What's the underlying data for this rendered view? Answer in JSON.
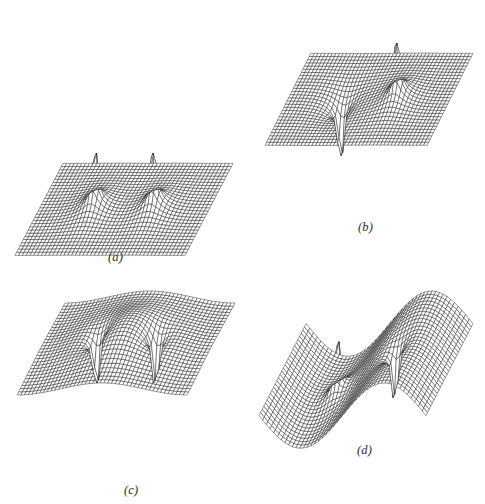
{
  "figure": {
    "background_color": "#ffffff",
    "ink_color": "#111111",
    "label_color": "#2b2b2b",
    "width": 485,
    "height": 504
  },
  "panels": [
    {
      "id": "a",
      "label": "(a)",
      "label_x": 108,
      "label_y": 250,
      "origin_x": 12,
      "origin_y": 150,
      "plot_width": 218,
      "plot_height": 100,
      "description": "two positive singular peaks on a flat plane"
    },
    {
      "id": "b",
      "label": "(b)",
      "label_x": 358,
      "label_y": 220,
      "origin_x": 262,
      "origin_y": 40,
      "plot_width": 208,
      "plot_height": 100,
      "description": "one positive peak and one negative spike on a flat plane"
    },
    {
      "id": "c",
      "label": "(c)",
      "label_x": 124,
      "label_y": 483,
      "origin_x": 14,
      "origin_y": 288,
      "plot_width": 218,
      "plot_height": 100,
      "description": "two negative spikes beneath an undulating raised surface"
    },
    {
      "id": "d",
      "label": "(d)",
      "label_x": 357,
      "label_y": 443,
      "origin_x": 256,
      "origin_y": 288,
      "plot_width": 214,
      "plot_height": 100,
      "description": "one positive peak and one negative spike on a twisted saddle surface"
    }
  ],
  "chart_data": [
    {
      "type": "surface",
      "panel": "a",
      "title": "(a)",
      "xlabel": "",
      "ylabel": "",
      "zlabel": "",
      "grid": true,
      "legend": "none",
      "nu": 46,
      "nv": 30,
      "xlim": [
        -3,
        3
      ],
      "ylim": [
        -1.6,
        1.6
      ],
      "zlim": [
        0,
        9.5
      ],
      "projection": {
        "az_x": 0.88,
        "az_y": 0.3,
        "z_scale": 20.5
      },
      "sources": [
        {
          "x": -1.05,
          "y": 0.0,
          "amplitude": 1.0,
          "sigma": 0.2
        },
        {
          "x": 1.05,
          "y": 0.0,
          "amplitude": 1.0,
          "sigma": 0.2
        }
      ],
      "baseline": 0.0,
      "peak_screen_points": [
        {
          "x": 71,
          "y": 12
        },
        {
          "x": 158,
          "y": 8
        }
      ]
    },
    {
      "type": "surface",
      "panel": "b",
      "title": "(b)",
      "xlabel": "",
      "ylabel": "",
      "zlabel": "",
      "grid": true,
      "legend": "none",
      "nu": 46,
      "nv": 30,
      "xlim": [
        -3,
        3
      ],
      "ylim": [
        -1.6,
        1.6
      ],
      "zlim": [
        -9.5,
        9.5
      ],
      "projection": {
        "az_x": 0.88,
        "az_y": 0.3,
        "z_scale": 20.5
      },
      "sources": [
        {
          "x": -1.05,
          "y": 0.0,
          "amplitude": -1.0,
          "sigma": 0.2
        },
        {
          "x": 1.05,
          "y": 0.0,
          "amplitude": 1.0,
          "sigma": 0.2
        }
      ],
      "baseline": 0.0,
      "peak_screen_points": [
        {
          "x": 404,
          "y": 42
        },
        {
          "x": 330,
          "y": 220
        }
      ]
    },
    {
      "type": "surface",
      "panel": "c",
      "title": "(c)",
      "xlabel": "",
      "ylabel": "",
      "zlabel": "",
      "grid": true,
      "legend": "none",
      "nu": 46,
      "nv": 30,
      "xlim": [
        -3,
        3
      ],
      "ylim": [
        -1.6,
        1.6
      ],
      "zlim": [
        -9.5,
        4.0
      ],
      "projection": {
        "az_x": 0.88,
        "az_y": 0.3,
        "z_scale": 20.5
      },
      "sources": [
        {
          "x": -1.05,
          "y": 0.0,
          "amplitude": -1.0,
          "sigma": 0.2
        },
        {
          "x": 1.05,
          "y": 0.0,
          "amplitude": -1.0,
          "sigma": 0.2
        }
      ],
      "baseline": 1.5,
      "peak_screen_points": [
        {
          "x": 86,
          "y": 468
        },
        {
          "x": 165,
          "y": 455
        }
      ]
    },
    {
      "type": "surface",
      "panel": "d",
      "title": "(d)",
      "xlabel": "",
      "ylabel": "",
      "zlabel": "",
      "grid": true,
      "legend": "none",
      "nu": 46,
      "nv": 30,
      "xlim": [
        -3,
        3
      ],
      "ylim": [
        -1.6,
        1.6
      ],
      "zlim": [
        -9.5,
        9.5
      ],
      "projection": {
        "az_x": 0.88,
        "az_y": 0.3,
        "z_scale": 20.5
      },
      "sources": [
        {
          "x": -1.05,
          "y": 0.0,
          "amplitude": 1.0,
          "sigma": 0.2
        },
        {
          "x": 1.05,
          "y": 0.0,
          "amplitude": -1.0,
          "sigma": 0.2
        }
      ],
      "baseline": 0.0,
      "tilt": 1.6,
      "peak_screen_points": [
        {
          "x": 323,
          "y": 290
        },
        {
          "x": 410,
          "y": 455
        }
      ]
    }
  ]
}
